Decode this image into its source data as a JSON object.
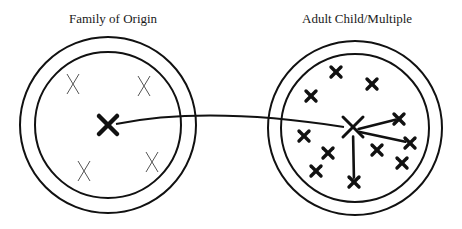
{
  "diagram": {
    "left": {
      "title": "Family of Origin",
      "outer_circle": {
        "cx": 108,
        "cy": 125,
        "r": 88
      },
      "inner_circle": {
        "cx": 108,
        "cy": 125,
        "r": 73
      },
      "center_marker": {
        "x": 108,
        "y": 125,
        "size": 9
      },
      "members": [
        {
          "x": 73,
          "y": 84
        },
        {
          "x": 144,
          "y": 86
        },
        {
          "x": 84,
          "y": 171
        },
        {
          "x": 152,
          "y": 162
        }
      ]
    },
    "right": {
      "title": "Adult Child/Multiple",
      "outer_circle": {
        "cx": 355,
        "cy": 128,
        "r": 87
      },
      "inner_circle": {
        "cx": 355,
        "cy": 128,
        "r": 74
      },
      "center_marker": {
        "x": 353,
        "y": 127,
        "size": 10
      },
      "members": [
        {
          "x": 336,
          "y": 72
        },
        {
          "x": 372,
          "y": 84
        },
        {
          "x": 311,
          "y": 96
        },
        {
          "x": 399,
          "y": 119
        },
        {
          "x": 410,
          "y": 143
        },
        {
          "x": 402,
          "y": 163
        },
        {
          "x": 304,
          "y": 136
        },
        {
          "x": 328,
          "y": 153
        },
        {
          "x": 377,
          "y": 150
        },
        {
          "x": 316,
          "y": 171
        },
        {
          "x": 354,
          "y": 182
        }
      ],
      "connected_members": [
        3,
        4,
        10
      ]
    },
    "link": {
      "from": "left.center_marker",
      "to": "right.center_marker"
    },
    "colors": {
      "stroke": "#111111",
      "thin_marker": "#555555"
    }
  }
}
